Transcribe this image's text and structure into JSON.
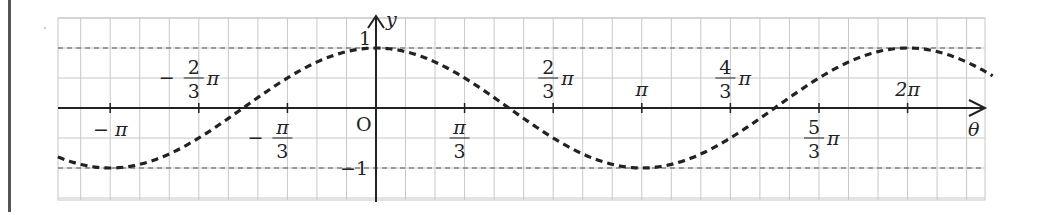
{
  "chart_data": {
    "type": "line",
    "title": "",
    "function": "y = cos θ",
    "xlabel": "θ",
    "ylabel": "y",
    "origin_label": "O",
    "xlim_pi": [
      -1.197,
      2.32
    ],
    "ylim": [
      -1.5,
      1.5
    ],
    "grid": true,
    "grid_step_x_pi": 0.1111,
    "grid_step_y": 0.5,
    "reference_lines": [
      {
        "y": 1,
        "style": "dashed"
      },
      {
        "y": -1,
        "style": "dashed"
      }
    ],
    "y_ticks": [
      {
        "value": 1,
        "label": "1"
      },
      {
        "value": -1,
        "label": "−1"
      }
    ],
    "x_ticks": [
      {
        "value_pi": -1,
        "label_num": "",
        "label_den": "",
        "prefix": "−",
        "suffix": "π",
        "position": "below"
      },
      {
        "value_pi": -0.6667,
        "label_num": "2",
        "label_den": "3",
        "prefix": "−",
        "suffix": "π",
        "position": "above"
      },
      {
        "value_pi": -0.3333,
        "label_num": "π",
        "label_den": "3",
        "prefix": "−",
        "suffix": "",
        "position": "below"
      },
      {
        "value_pi": 0.3333,
        "label_num": "π",
        "label_den": "3",
        "prefix": "",
        "suffix": "",
        "position": "below"
      },
      {
        "value_pi": 0.6667,
        "label_num": "2",
        "label_den": "3",
        "prefix": "",
        "suffix": "π",
        "position": "above"
      },
      {
        "value_pi": 1,
        "label_num": "",
        "label_den": "",
        "prefix": "",
        "suffix": "π",
        "position": "above"
      },
      {
        "value_pi": 1.3333,
        "label_num": "4",
        "label_den": "3",
        "prefix": "",
        "suffix": "π",
        "position": "above"
      },
      {
        "value_pi": 1.6667,
        "label_num": "5",
        "label_den": "3",
        "prefix": "",
        "suffix": "π",
        "position": "below"
      },
      {
        "value_pi": 2,
        "label_num": "",
        "label_den": "",
        "prefix": "",
        "suffix": "2π",
        "position": "above"
      }
    ],
    "series": [
      {
        "name": "cos θ",
        "style": "dashed",
        "color": "#222222",
        "x_range_pi": [
          -1.197,
          2.32
        ],
        "samples": "computed from cos"
      }
    ]
  }
}
